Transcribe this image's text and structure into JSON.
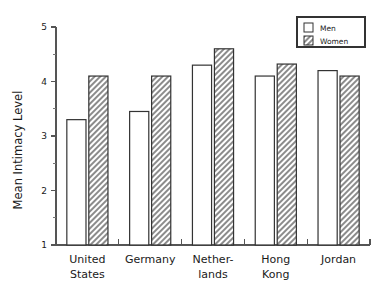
{
  "chart_data": {
    "type": "bar",
    "title": "",
    "subtitle": "",
    "xlabel": "",
    "ylabel": "Mean Intimacy Level",
    "ylim": [
      1,
      5
    ],
    "yticks": [
      1,
      2,
      3,
      4,
      5
    ],
    "ytick_labels": [
      "1",
      "2",
      "3",
      "4",
      "5"
    ],
    "minor_ticks": [
      1.5,
      2.5,
      3.5,
      4.5
    ],
    "grid": false,
    "legend_position": "top-right",
    "categories": [
      "United States",
      "Germany",
      "Netherlands",
      "Hong Kong",
      "Jordan"
    ],
    "category_lines": [
      [
        "United",
        "States"
      ],
      [
        "Germany",
        ""
      ],
      [
        "Nether-",
        "lands"
      ],
      [
        "Hong",
        "Kong"
      ],
      [
        "Jordan",
        ""
      ]
    ],
    "series": [
      {
        "name": "Men",
        "fill": "solid-white",
        "color": "#ffffff",
        "values": [
          3.3,
          3.45,
          4.3,
          4.1,
          4.2
        ]
      },
      {
        "name": "Women",
        "fill": "diagonal-hatch",
        "color": "#808080",
        "values": [
          4.1,
          4.1,
          4.6,
          4.32,
          4.1
        ]
      }
    ]
  },
  "legend": {
    "entries": [
      {
        "label": "Men",
        "swatch": "men-swatch"
      },
      {
        "label": "Women",
        "swatch": "women-swatch"
      }
    ]
  },
  "axis": {
    "y_title": "Mean Intimacy Level"
  }
}
